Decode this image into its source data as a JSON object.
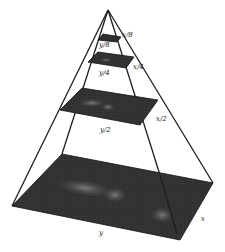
{
  "diagram": {
    "levels": [
      {
        "name": "level-3",
        "width_label": "y/8",
        "height_label": "x/8"
      },
      {
        "name": "level-2",
        "width_label": "y/4",
        "height_label": "x/4"
      },
      {
        "name": "level-1",
        "width_label": "y/2",
        "height_label": "x/2"
      },
      {
        "name": "level-0",
        "width_label": "y",
        "height_label": "x"
      }
    ],
    "colors": {
      "background": "#ffffff",
      "edge": "#1e1e1e",
      "plane_dark": "#2a2a2a",
      "plane_mid": "#4a4a4a",
      "blob": "#6b6b6b"
    }
  }
}
